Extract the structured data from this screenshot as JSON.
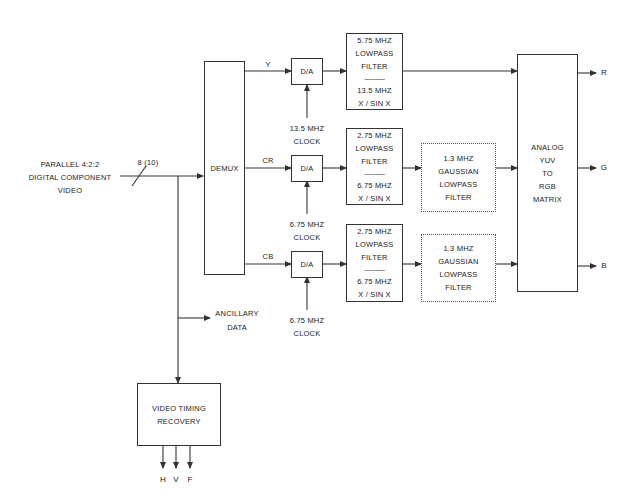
{
  "input": {
    "lines": [
      "PARALLEL 4:2:2",
      "DIGITAL COMPONENT",
      "VIDEO"
    ],
    "bus_width": "8 (10)"
  },
  "demux": {
    "label": "DEMUX"
  },
  "channels": [
    {
      "name": "Y",
      "dac": "D/A",
      "clock": [
        "13.5 MHZ",
        "CLOCK"
      ],
      "filter": {
        "top": [
          "5.75 MHZ",
          "LOWPASS",
          "FILTER"
        ],
        "divider": "-----------",
        "bottom": [
          "13.5 MHZ",
          "X / SIN X"
        ]
      },
      "output": "R"
    },
    {
      "name": "CR",
      "dac": "D/A",
      "clock": [
        "6.75 MHZ",
        "CLOCK"
      ],
      "filter": {
        "top": [
          "2.75 MHZ",
          "LOWPASS",
          "FILTER"
        ],
        "divider": "-----------",
        "bottom": [
          "6.75 MHZ",
          "X / SIN X"
        ]
      },
      "gaussian": [
        "1.3 MHZ",
        "GAUSSIAN",
        "LOWPASS",
        "FILTER"
      ],
      "output": "G"
    },
    {
      "name": "CB",
      "dac": "D/A",
      "clock": [
        "6.75 MHZ",
        "CLOCK"
      ],
      "filter": {
        "top": [
          "2.75 MHZ",
          "LOWPASS",
          "FILTER"
        ],
        "divider": "-----------",
        "bottom": [
          "6.75 MHZ",
          "X / SIN X"
        ]
      },
      "gaussian": [
        "1.3 MHZ",
        "GAUSSIAN",
        "LOWPASS",
        "FILTER"
      ],
      "output": "B"
    }
  ],
  "matrix": {
    "lines": [
      "ANALOG",
      "YUV",
      "TO",
      "RGB",
      "MATRIX"
    ]
  },
  "ancillary": {
    "lines": [
      "ANCILLARY",
      "DATA"
    ]
  },
  "timing": {
    "lines": [
      "VIDEO TIMING",
      "RECOVERY"
    ],
    "outputs": [
      "H",
      "V",
      "F"
    ]
  },
  "colors": {
    "line": "#333333",
    "text": "#222222",
    "background": "#ffffff"
  }
}
